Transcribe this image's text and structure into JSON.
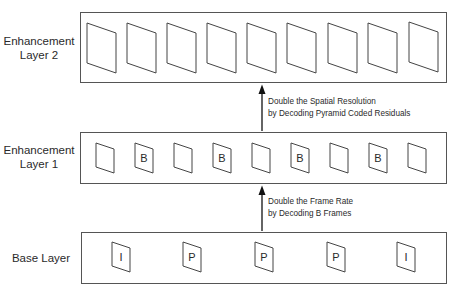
{
  "diagram": {
    "layers": [
      {
        "id": "enhancement-layer-2",
        "label_line1": "Enhancement",
        "label_line2": "Layer 2",
        "frames": [
          "",
          "",
          "",
          "",
          "",
          "",
          "",
          "",
          ""
        ]
      },
      {
        "id": "enhancement-layer-1",
        "label_line1": "Enhancement",
        "label_line2": "Layer 1",
        "frames": [
          "",
          "B",
          "",
          "B",
          "",
          "B",
          "",
          "B",
          ""
        ]
      },
      {
        "id": "base-layer",
        "label_line1": "Base Layer",
        "label_line2": "",
        "frames": [
          "I",
          "P",
          "P",
          "P",
          "I"
        ]
      }
    ],
    "arrows": [
      {
        "from": "enhancement-layer-1",
        "to": "enhancement-layer-2",
        "line1": "Double the Spatial Resolution",
        "line2": "by Decoding Pyramid Coded Residuals"
      },
      {
        "from": "base-layer",
        "to": "enhancement-layer-1",
        "line1": "Double the Frame Rate",
        "line2": "by Decoding B Frames"
      }
    ]
  }
}
